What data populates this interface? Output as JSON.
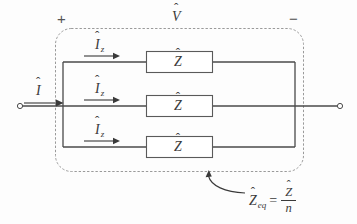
{
  "diagram": {
    "type": "electrical-circuit-schematic",
    "polarity": {
      "plus": "+",
      "minus": "−"
    },
    "voltage_label": {
      "symbol": "V",
      "accent": "ˆ"
    },
    "total_current_label": {
      "symbol": "I",
      "accent": "ˆ"
    },
    "branches": [
      {
        "id": "branch-top",
        "current_symbol": "I",
        "current_accent": "ˆ",
        "current_subscript": "z",
        "element_symbol": "Z",
        "element_accent": "ˆ"
      },
      {
        "id": "branch-middle",
        "current_symbol": "I",
        "current_accent": "ˆ",
        "current_subscript": "z",
        "element_symbol": "Z",
        "element_accent": "ˆ"
      },
      {
        "id": "branch-bottom",
        "current_symbol": "I",
        "current_accent": "ˆ",
        "current_subscript": "z",
        "element_symbol": "Z",
        "element_accent": "ˆ"
      }
    ],
    "equation": {
      "lhs_symbol": "Z",
      "lhs_accent": "ˆ",
      "lhs_subscript": "eq",
      "operator": "=",
      "numerator_symbol": "Z",
      "numerator_accent": "ˆ",
      "denominator": "n"
    },
    "colors": {
      "background": "#fdfdfd",
      "wire": "#4a4a4a",
      "component_outline": "#5a5a5a",
      "dashed_boundary": "#9a9a9a",
      "text": "#3a3a3a"
    }
  }
}
